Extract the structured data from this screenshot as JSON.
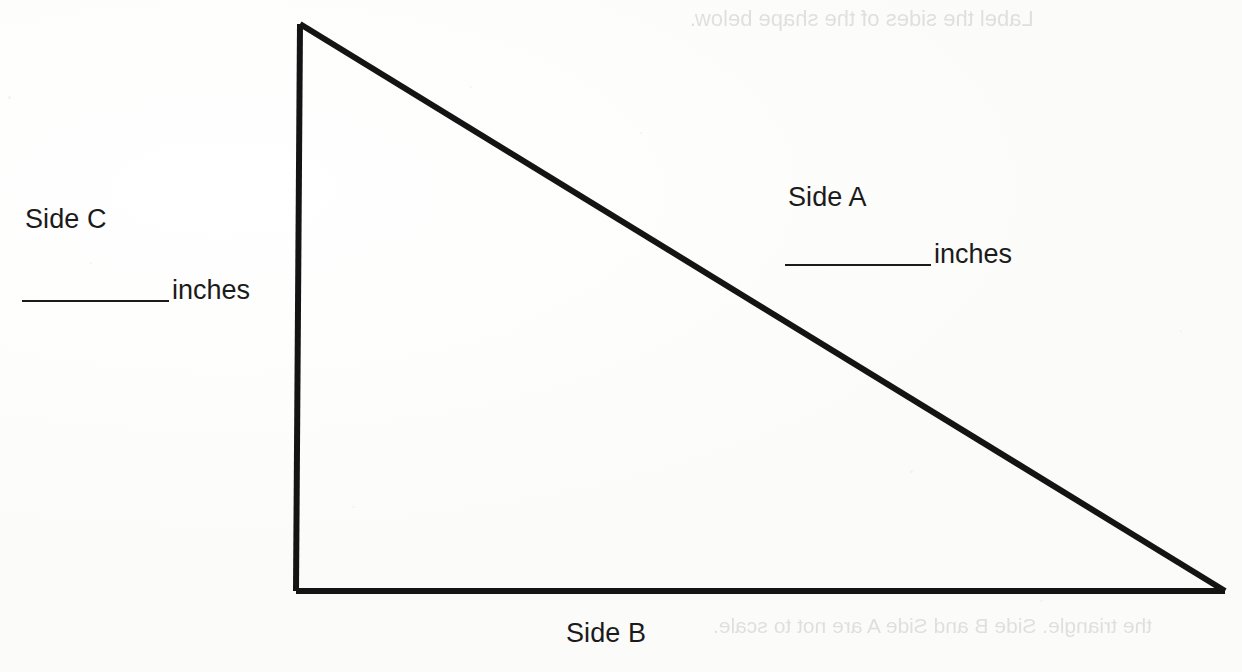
{
  "worksheet": {
    "figure": {
      "shape_name": "right-triangle",
      "stroke_color": "#141414",
      "stroke_width": 6,
      "vertices": {
        "apex": [
          300,
          24
        ],
        "bottom_left": [
          296,
          591
        ],
        "bottom_right": [
          1225,
          591
        ]
      }
    },
    "labels": {
      "side_a": "Side A",
      "side_b": "Side B",
      "side_c": "Side C"
    },
    "answers": {
      "side_a_value": "",
      "side_a_unit": "inches",
      "side_c_value": "",
      "side_c_unit": "inches"
    },
    "ghost_text": {
      "top_right": "Label the sides of the shape below.",
      "bottom_right": "the triangle. Side B and Side A are not to scale."
    }
  }
}
